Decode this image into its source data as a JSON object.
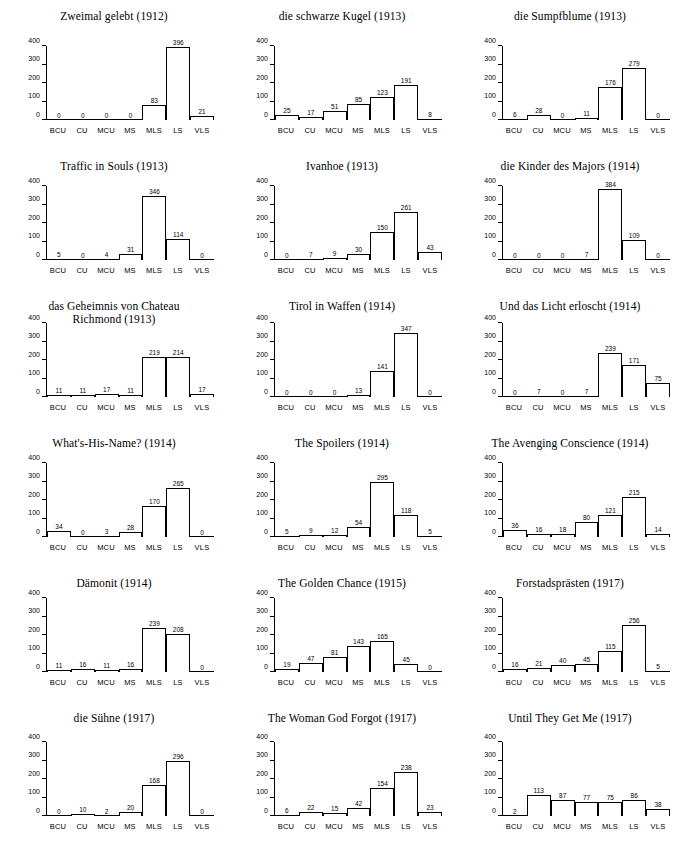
{
  "figure": {
    "categories": [
      "BCU",
      "CU",
      "MCU",
      "MS",
      "MLS",
      "LS",
      "VLS"
    ],
    "yticks": [
      0,
      100,
      200,
      300,
      400
    ],
    "ylim": [
      0,
      400
    ],
    "grid": false,
    "panel_count": 18,
    "columns": 3,
    "rows": 6
  },
  "chart_data": [
    {
      "type": "bar",
      "title": "Zweimal gelebt (1912)",
      "xlabel": "",
      "ylabel": "",
      "ylim": [
        0,
        400
      ],
      "yticks": [
        0,
        100,
        200,
        300,
        400
      ],
      "categories": [
        "BCU",
        "CU",
        "MCU",
        "MS",
        "MLS",
        "LS",
        "VLS"
      ],
      "values": [
        0,
        0,
        0,
        0,
        83,
        396,
        21
      ]
    },
    {
      "type": "bar",
      "title": "die schwarze Kugel (1913)",
      "xlabel": "",
      "ylabel": "",
      "ylim": [
        0,
        400
      ],
      "yticks": [
        0,
        100,
        200,
        300,
        400
      ],
      "categories": [
        "BCU",
        "CU",
        "MCU",
        "MS",
        "MLS",
        "LS",
        "VLS"
      ],
      "values": [
        25,
        17,
        51,
        85,
        123,
        191,
        8
      ]
    },
    {
      "type": "bar",
      "title": "die Sumpfblume (1913)",
      "xlabel": "",
      "ylabel": "",
      "ylim": [
        0,
        400
      ],
      "yticks": [
        0,
        100,
        200,
        300,
        400
      ],
      "categories": [
        "BCU",
        "CU",
        "MCU",
        "MS",
        "MLS",
        "LS",
        "VLS"
      ],
      "values": [
        6,
        28,
        0,
        11,
        176,
        279,
        0
      ]
    },
    {
      "type": "bar",
      "title": "Traffic in Souls (1913)",
      "xlabel": "",
      "ylabel": "",
      "ylim": [
        0,
        400
      ],
      "yticks": [
        0,
        100,
        200,
        300,
        400
      ],
      "categories": [
        "BCU",
        "CU",
        "MCU",
        "MS",
        "MLS",
        "LS",
        "VLS"
      ],
      "values": [
        5,
        0,
        4,
        31,
        346,
        114,
        0
      ]
    },
    {
      "type": "bar",
      "title": "Ivanhoe (1913)",
      "xlabel": "",
      "ylabel": "",
      "ylim": [
        0,
        400
      ],
      "yticks": [
        0,
        100,
        200,
        300,
        400
      ],
      "categories": [
        "BCU",
        "CU",
        "MCU",
        "MS",
        "MLS",
        "LS",
        "VLS"
      ],
      "values": [
        0,
        7,
        9,
        30,
        150,
        261,
        43
      ]
    },
    {
      "type": "bar",
      "title": "die Kinder des Majors (1914)",
      "xlabel": "",
      "ylabel": "",
      "ylim": [
        0,
        400
      ],
      "yticks": [
        0,
        100,
        200,
        300,
        400
      ],
      "categories": [
        "BCU",
        "CU",
        "MCU",
        "MS",
        "MLS",
        "LS",
        "VLS"
      ],
      "values": [
        0,
        0,
        0,
        7,
        384,
        109,
        0
      ]
    },
    {
      "type": "bar",
      "title": "das Geheimnis von Chateau\nRichmond (1913)",
      "xlabel": "",
      "ylabel": "",
      "ylim": [
        0,
        400
      ],
      "yticks": [
        0,
        100,
        200,
        300,
        400
      ],
      "categories": [
        "BCU",
        "CU",
        "MCU",
        "MS",
        "MLS",
        "LS",
        "VLS"
      ],
      "values": [
        11,
        11,
        17,
        11,
        219,
        214,
        17
      ]
    },
    {
      "type": "bar",
      "title": "Tirol in Waffen (1914)",
      "xlabel": "",
      "ylabel": "",
      "ylim": [
        0,
        400
      ],
      "yticks": [
        0,
        100,
        200,
        300,
        400
      ],
      "categories": [
        "BCU",
        "CU",
        "MCU",
        "MS",
        "MLS",
        "LS",
        "VLS"
      ],
      "values": [
        0,
        0,
        0,
        13,
        141,
        347,
        0
      ]
    },
    {
      "type": "bar",
      "title": "Und das Licht erloscht (1914)",
      "xlabel": "",
      "ylabel": "",
      "ylim": [
        0,
        400
      ],
      "yticks": [
        0,
        100,
        200,
        300,
        400
      ],
      "categories": [
        "BCU",
        "CU",
        "MCU",
        "MS",
        "MLS",
        "LS",
        "VLS"
      ],
      "values": [
        0,
        7,
        0,
        7,
        239,
        171,
        75
      ]
    },
    {
      "type": "bar",
      "title": "What's-His-Name? (1914)",
      "xlabel": "",
      "ylabel": "",
      "ylim": [
        0,
        400
      ],
      "yticks": [
        0,
        100,
        200,
        300,
        400
      ],
      "categories": [
        "BCU",
        "CU",
        "MCU",
        "MS",
        "MLS",
        "LS",
        "VLS"
      ],
      "values": [
        34,
        0,
        3,
        28,
        170,
        265,
        0
      ]
    },
    {
      "type": "bar",
      "title": "The Spoilers (1914)",
      "xlabel": "",
      "ylabel": "",
      "ylim": [
        0,
        400
      ],
      "yticks": [
        0,
        100,
        200,
        300,
        400
      ],
      "categories": [
        "BCU",
        "CU",
        "MCU",
        "MS",
        "MLS",
        "LS",
        "VLS"
      ],
      "values": [
        5,
        9,
        12,
        54,
        295,
        118,
        5
      ]
    },
    {
      "type": "bar",
      "title": "The Avenging Conscience (1914)",
      "xlabel": "",
      "ylabel": "",
      "ylim": [
        0,
        400
      ],
      "yticks": [
        0,
        100,
        200,
        300,
        400
      ],
      "categories": [
        "BCU",
        "CU",
        "MCU",
        "MS",
        "MLS",
        "LS",
        "VLS"
      ],
      "values": [
        36,
        16,
        18,
        80,
        121,
        215,
        14
      ]
    },
    {
      "type": "bar",
      "title": "Dämonit (1914)",
      "xlabel": "",
      "ylabel": "",
      "ylim": [
        0,
        400
      ],
      "yticks": [
        0,
        100,
        200,
        300,
        400
      ],
      "categories": [
        "BCU",
        "CU",
        "MCU",
        "MS",
        "MLS",
        "LS",
        "VLS"
      ],
      "values": [
        11,
        16,
        11,
        16,
        239,
        208,
        0
      ]
    },
    {
      "type": "bar",
      "title": "The Golden Chance (1915)",
      "xlabel": "",
      "ylabel": "",
      "ylim": [
        0,
        400
      ],
      "yticks": [
        0,
        100,
        200,
        300,
        400
      ],
      "categories": [
        "BCU",
        "CU",
        "MCU",
        "MS",
        "MLS",
        "LS",
        "VLS"
      ],
      "values": [
        19,
        47,
        81,
        143,
        165,
        45,
        0
      ]
    },
    {
      "type": "bar",
      "title": "Forstadsprästen (1917)",
      "xlabel": "",
      "ylabel": "",
      "ylim": [
        0,
        400
      ],
      "yticks": [
        0,
        100,
        200,
        300,
        400
      ],
      "categories": [
        "BCU",
        "CU",
        "MCU",
        "MS",
        "MLS",
        "LS",
        "VLS"
      ],
      "values": [
        16,
        21,
        40,
        45,
        115,
        256,
        5
      ]
    },
    {
      "type": "bar",
      "title": "die Sühne (1917)",
      "xlabel": "",
      "ylabel": "",
      "ylim": [
        0,
        400
      ],
      "yticks": [
        0,
        100,
        200,
        300,
        400
      ],
      "categories": [
        "BCU",
        "CU",
        "MCU",
        "MS",
        "MLS",
        "LS",
        "VLS"
      ],
      "values": [
        0,
        10,
        2,
        20,
        168,
        296,
        0
      ]
    },
    {
      "type": "bar",
      "title": "The Woman God Forgot (1917)",
      "xlabel": "",
      "ylabel": "",
      "ylim": [
        0,
        400
      ],
      "yticks": [
        0,
        100,
        200,
        300,
        400
      ],
      "categories": [
        "BCU",
        "CU",
        "MCU",
        "MS",
        "MLS",
        "LS",
        "VLS"
      ],
      "values": [
        6,
        22,
        15,
        42,
        154,
        238,
        23
      ]
    },
    {
      "type": "bar",
      "title": "Until They Get Me (1917)",
      "xlabel": "",
      "ylabel": "",
      "ylim": [
        0,
        400
      ],
      "yticks": [
        0,
        100,
        200,
        300,
        400
      ],
      "categories": [
        "BCU",
        "CU",
        "MCU",
        "MS",
        "MLS",
        "LS",
        "VLS"
      ],
      "values": [
        2,
        113,
        87,
        77,
        75,
        86,
        38
      ]
    }
  ]
}
